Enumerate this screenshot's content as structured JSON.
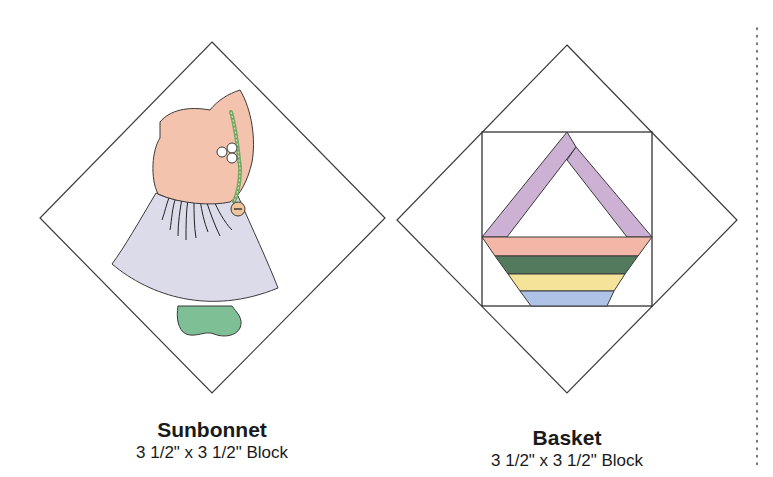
{
  "blocks": [
    {
      "name": "Sunbonnet",
      "size": "3 1/2\" x 3 1/2\" Block"
    },
    {
      "name": "Basket",
      "size": "3 1/2\" x 3 1/2\" Block"
    }
  ],
  "colors": {
    "outline": "#3a3a3a",
    "bonnet": "#f4c3ad",
    "dress": "#dcdbea",
    "shoe": "#7fbf95",
    "trim": "#74a860",
    "button": "#f0c49a",
    "handle": "#cdb1d4",
    "stripe_pink": "#f2b7a6",
    "stripe_green": "#547a5e",
    "stripe_yellow": "#f6e39a",
    "stripe_blue": "#afc3e6",
    "dotted_line": "#555555"
  }
}
